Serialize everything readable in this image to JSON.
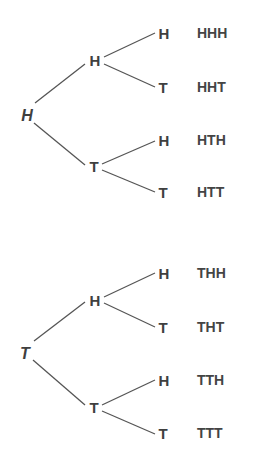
{
  "trees": [
    {
      "root": "H",
      "branches": [
        {
          "label": "H",
          "leaves": [
            {
              "label": "H",
              "outcome": "HHH"
            },
            {
              "label": "T",
              "outcome": "HHT"
            }
          ]
        },
        {
          "label": "T",
          "leaves": [
            {
              "label": "H",
              "outcome": "HTH"
            },
            {
              "label": "T",
              "outcome": "HTT"
            }
          ]
        }
      ]
    },
    {
      "root": "T",
      "branches": [
        {
          "label": "H",
          "leaves": [
            {
              "label": "H",
              "outcome": "THH"
            },
            {
              "label": "T",
              "outcome": "THT"
            }
          ]
        },
        {
          "label": "T",
          "leaves": [
            {
              "label": "H",
              "outcome": "TTH"
            },
            {
              "label": "T",
              "outcome": "TTT"
            }
          ]
        }
      ]
    }
  ],
  "colors": {
    "text": "#3f3f3f",
    "line": "#555555",
    "background": "#ffffff"
  }
}
